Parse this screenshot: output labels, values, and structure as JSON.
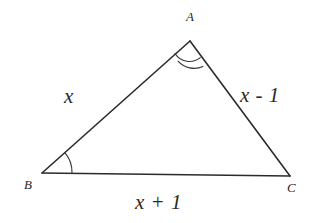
{
  "figure": {
    "kind": "geometry-triangle-diagram",
    "background_color": "#ffffff",
    "stroke_color": "#2b2b2b",
    "stroke_width": 1.6
  },
  "vertices": {
    "a": {
      "label": "A",
      "x": 190,
      "y": 41
    },
    "b": {
      "label": "B",
      "x": 42,
      "y": 173
    },
    "c": {
      "label": "C",
      "x": 290,
      "y": 176
    }
  },
  "sides": {
    "ab": {
      "label": "x",
      "from": "B",
      "to": "A"
    },
    "ac": {
      "label": "x - 1",
      "from": "A",
      "to": "C"
    },
    "bc": {
      "label": "x + 1",
      "from": "B",
      "to": "C"
    }
  },
  "angle_marks": {
    "at_a": {
      "arcs": 2,
      "vertex": "A"
    },
    "at_b": {
      "arcs": 1,
      "vertex": "B"
    }
  }
}
